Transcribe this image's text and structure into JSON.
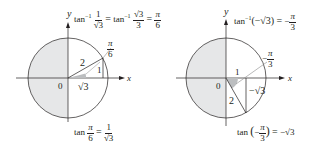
{
  "figure": {
    "left": {
      "axis_labels": {
        "x": "x",
        "y": "y"
      },
      "origin_label": "0",
      "header": {
        "lhs_fn": "tan",
        "lhs_sup": "−1",
        "lhs_num": "1",
        "lhs_den": "√3",
        "eq1": "=",
        "mid_fn": "tan",
        "mid_sup": "−1",
        "mid_num": "√3",
        "mid_den": "3",
        "eq2": "=",
        "rhs_num": "π",
        "rhs_den": "6"
      },
      "angle_label": {
        "num": "π",
        "den": "6"
      },
      "side_labels": {
        "hypotenuse": "2",
        "opposite": "1",
        "adjacent": "√3"
      },
      "footer": {
        "fn": "tan",
        "arg_num": "π",
        "arg_den": "6",
        "eq": "=",
        "rhs_num": "1",
        "rhs_den": "√3"
      }
    },
    "right": {
      "axis_labels": {
        "x": "x",
        "y": "y"
      },
      "origin_label": "0",
      "header": {
        "fn": "tan",
        "sup": "−1",
        "arg": "(−√3)",
        "eq": "=",
        "rhs_sign": "−",
        "rhs_num": "π",
        "rhs_den": "3"
      },
      "angle_label": {
        "sign": "−",
        "num": "π",
        "den": "3"
      },
      "side_labels": {
        "hypotenuse": "2",
        "adjacent": "1",
        "opposite": "−√3"
      },
      "footer": {
        "fn": "tan",
        "arg_sign": "−",
        "arg_num": "π",
        "arg_den": "3",
        "eq": "=",
        "rhs": "−√3"
      }
    },
    "colors": {
      "shade": "#e6e7e8",
      "line": "#231f20",
      "pointer": "#8a8a8a"
    }
  }
}
